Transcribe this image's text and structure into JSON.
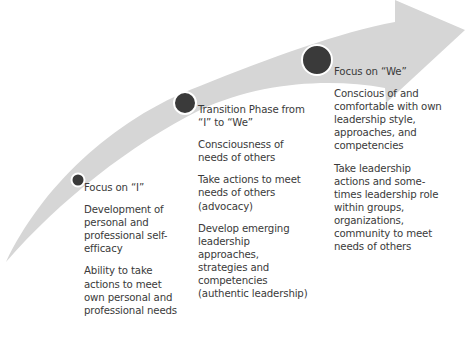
{
  "diagram": {
    "type": "curved-progression-arrow",
    "colors": {
      "arrow_fill": "#d6d6d6",
      "marker_fill": "#3a3a3a",
      "marker_stroke": "#ffffff",
      "text": "#3a3a3a"
    },
    "stages": [
      {
        "title": "Focus on “I”",
        "points": [
          "Development of personal and professional self-efficacy",
          "Ability to take actions to meet own personal and professional needs"
        ]
      },
      {
        "title": "Transition Phase from “I” to “We”",
        "points": [
          "Consciousness of needs of others",
          "Take actions to meet needs of others (advocacy)",
          "Develop emerging leadership approaches, strategies and competencies (authentic leadership)"
        ]
      },
      {
        "title": "Focus on “We”",
        "points": [
          "Conscious of and comfortable with own leadership style, approaches, and competencies",
          "Take leadership actions and some-times leadership role within groups, organizations, community to meet needs of others"
        ]
      }
    ]
  }
}
